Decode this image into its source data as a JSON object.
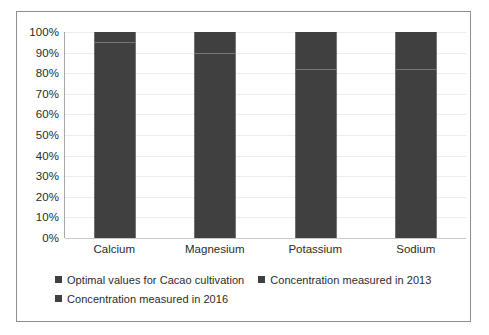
{
  "chart_data": {
    "type": "bar",
    "subtype": "100% stacked column",
    "title": "",
    "xlabel": "",
    "ylabel": "",
    "ylim": [
      0,
      100
    ],
    "yticks": [
      "0%",
      "10%",
      "20%",
      "30%",
      "40%",
      "50%",
      "60%",
      "70%",
      "80%",
      "90%",
      "100%"
    ],
    "ytick_values": [
      0,
      10,
      20,
      30,
      40,
      50,
      60,
      70,
      80,
      90,
      100
    ],
    "grid": true,
    "grid_axis": "y",
    "legend_position": "bottom",
    "categories": [
      "Calcium",
      "Magnesium",
      "Potassium",
      "Sodium"
    ],
    "series": [
      {
        "name": "Optimal values for Cacao cultivation",
        "color": "#404040",
        "values": [
          95,
          90,
          82,
          82
        ]
      },
      {
        "name": "Concentration measured in 2013",
        "color": "#404040",
        "values": [
          5,
          10,
          18,
          18
        ]
      },
      {
        "name": "Concentration measured in 2016",
        "color": "#404040",
        "values": [
          0,
          0,
          0,
          0
        ]
      }
    ],
    "segment_boundaries_percent": [
      95,
      90,
      82,
      82
    ]
  },
  "legend": {
    "rows": [
      [
        {
          "label": "Optimal values for Cacao cultivation",
          "color": "#404040"
        },
        {
          "label": "Concentration measured in 2013",
          "color": "#404040"
        }
      ],
      [
        {
          "label": "Concentration measured in 2016",
          "color": "#404040"
        }
      ]
    ]
  },
  "colors": {
    "bar": "#404040",
    "gridline": "#ededed",
    "axis_line": "#a8a8a8",
    "frame": "#8e8e8e",
    "text": "#2b2b2b",
    "background": "#ffffff"
  }
}
